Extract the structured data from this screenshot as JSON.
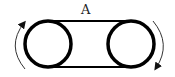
{
  "diagram": {
    "belt_label": "A",
    "components": {
      "left_pulley": {
        "cx": 48,
        "cy": 44,
        "r": 23
      },
      "right_pulley": {
        "cx": 131,
        "cy": 44,
        "r": 23
      },
      "belt": {
        "top_y": 21,
        "bottom_y": 67,
        "x1": 48,
        "x2": 131
      }
    },
    "arrows": [
      {
        "name": "left-rotation-arrow",
        "direction": "up"
      },
      {
        "name": "right-rotation-arrow",
        "direction": "down"
      }
    ],
    "colors": {
      "stroke": "#000000",
      "arrow": "#333333",
      "background": "#ffffff"
    }
  }
}
